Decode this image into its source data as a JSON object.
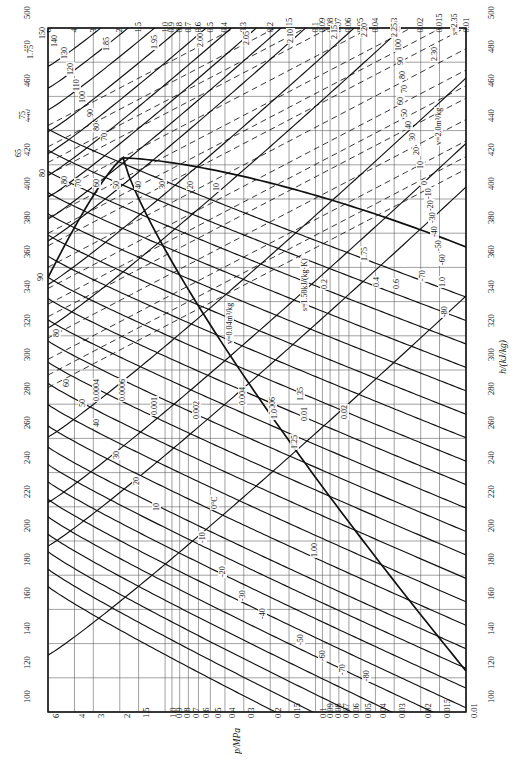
{
  "chart_data": {
    "type": "line",
    "xlabel": "p/MPa",
    "ylabel": "h/(kJ/kg)",
    "xscale": "log-reversed",
    "xlim": [
      6,
      0.01
    ],
    "ylim": [
      100,
      500
    ],
    "grid": true,
    "legend": "none",
    "pressure_ticks": [
      "6",
      "4",
      "3",
      "2",
      "1.5",
      "1.0",
      "0.9",
      "0.8",
      "0.7",
      "0.6",
      "0.5",
      "0.4",
      "0.3",
      "0.2",
      "0.15",
      "0.1",
      "0.09",
      "0.08",
      "0.07",
      "0.06",
      "0.05",
      "0.04",
      "0.03",
      "0.02",
      "0.015",
      "0.01"
    ],
    "pressure_tick_values": [
      6,
      4,
      3,
      2,
      1.5,
      1.0,
      0.9,
      0.8,
      0.7,
      0.6,
      0.5,
      0.4,
      0.3,
      0.2,
      0.15,
      0.1,
      0.09,
      0.08,
      0.07,
      0.06,
      0.05,
      0.04,
      0.03,
      0.02,
      0.015,
      0.01
    ],
    "enthalpy_ticks": [
      "500",
      "480",
      "460",
      "440",
      "420",
      "400",
      "380",
      "360",
      "340",
      "320",
      "300",
      "280",
      "260",
      "240",
      "220",
      "200",
      "180",
      "160",
      "140",
      "120",
      "100"
    ],
    "enthalpy_tick_values": [
      500,
      480,
      460,
      440,
      420,
      400,
      380,
      360,
      340,
      320,
      300,
      280,
      260,
      240,
      220,
      200,
      180,
      160,
      140,
      120,
      100
    ],
    "series_families": [
      {
        "name": "isotherms",
        "unit": "°C",
        "style": "solid",
        "labels": [
          "150",
          "140",
          "130",
          "120",
          "110",
          "100",
          "90",
          "80",
          "70",
          "60",
          "50",
          "40",
          "30",
          "20",
          "10",
          "0",
          "-10",
          "-20",
          "-30",
          "-40",
          "-50",
          "-60",
          "-70",
          "-80"
        ]
      },
      {
        "name": "isentropes",
        "unit": "kJ/(kg·K)",
        "style": "solid-steep",
        "labels": [
          "1.00",
          "1.25",
          "1.35",
          "1.50",
          "1.75",
          "1.85",
          "1.95",
          "2.00",
          "2.05",
          "2.10",
          "2.15",
          "2.20",
          "2.25",
          "2.30",
          "2.35"
        ]
      },
      {
        "name": "isochores",
        "unit": "m³/kg",
        "style": "dashed",
        "labels": [
          "0.0004",
          "0.0006",
          "0.001",
          "0.002",
          "0.004",
          "0.006",
          "0.01",
          "0.02",
          "0.04",
          "0.06",
          "0.1",
          "0.2",
          "0.4",
          "0.6",
          "1.0",
          "2.0"
        ]
      },
      {
        "name": "saturation-dome",
        "unit": "",
        "style": "thick-solid",
        "labels": []
      }
    ],
    "annotations": [
      {
        "text": "s=1.50kJ/(kg·K)",
        "x": 300,
        "y": 312
      },
      {
        "text": "v=0.04m³/kg",
        "x": 225,
        "y": 345
      },
      {
        "text": "v=2.0m³/kg",
        "x": 434,
        "y": 146
      },
      {
        "text": "0°C",
        "x": 210,
        "y": 510
      },
      {
        "text": "1.00",
        "x": 310,
        "y": 558
      },
      {
        "text": "1.25",
        "x": 290,
        "y": 450
      },
      {
        "text": "1.35",
        "x": 296,
        "y": 402
      },
      {
        "text": "1.75",
        "x": 360,
        "y": 262
      }
    ]
  },
  "axes": {
    "bottom_title": "p/MPa",
    "right_title": "h/(kJ/kg)",
    "corner_bottom_left": "100",
    "corner_bottom_right": "100",
    "corner_top_left": "500",
    "corner_top_right": "500"
  }
}
